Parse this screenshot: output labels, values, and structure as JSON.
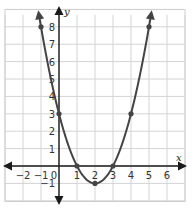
{
  "chart_data": {
    "type": "line",
    "title": "",
    "function": "y = x^2 - 4x + 3",
    "xlabel": "x",
    "ylabel": "y",
    "xlim": [
      -3,
      7
    ],
    "ylim": [
      -2,
      9
    ],
    "grid": true,
    "x_ticks": [
      "-2",
      "-1",
      "0",
      "1",
      "2",
      "3",
      "4",
      "5",
      "6"
    ],
    "y_ticks": [
      "-1",
      "1",
      "2",
      "3",
      "4",
      "5",
      "6",
      "7",
      "8"
    ],
    "points": [
      {
        "x": -1,
        "y": 8
      },
      {
        "x": 0,
        "y": 3
      },
      {
        "x": 1,
        "y": 0
      },
      {
        "x": 2,
        "y": -1
      },
      {
        "x": 3,
        "y": 0
      },
      {
        "x": 4,
        "y": 3
      },
      {
        "x": 5,
        "y": 8
      }
    ],
    "series": [
      {
        "name": "parabola",
        "x": [
          -1,
          0,
          1,
          2,
          3,
          4,
          5
        ],
        "values": [
          8,
          3,
          0,
          -1,
          0,
          3,
          8
        ]
      }
    ],
    "colors": {
      "curve": "#444444",
      "axis": "#1a1a1a",
      "grid": "#d4d4d4"
    }
  }
}
